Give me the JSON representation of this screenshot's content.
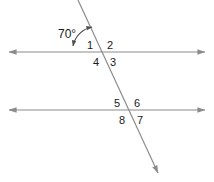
{
  "figure": {
    "background_color": "#ffffff",
    "line_color": "#8c8c8c",
    "text_color": "#1a1a1a",
    "arc_color": "#4d4d4d"
  },
  "angle_measure": {
    "value": "70°",
    "numeric": 70,
    "unit": "degrees"
  },
  "lines": [
    {
      "name": "upper-parallel-line",
      "type": "horizontal",
      "x1": 8,
      "y1": 52,
      "x2": 206,
      "y2": 52,
      "arrows": "both"
    },
    {
      "name": "lower-parallel-line",
      "type": "horizontal",
      "x1": 8,
      "y1": 110,
      "x2": 206,
      "y2": 110,
      "arrows": "both"
    },
    {
      "name": "transversal-line",
      "type": "oblique",
      "x1": 78,
      "y1": 0,
      "x2": 160,
      "y2": 178,
      "arrows": "end"
    }
  ],
  "intersections": [
    {
      "name": "upper-intersection",
      "x": 101,
      "y": 52
    },
    {
      "name": "lower-intersection",
      "x": 128,
      "y": 110
    }
  ],
  "angle_labels": [
    {
      "id": "1",
      "text": "1",
      "x": 90,
      "y": 48,
      "position": "upper-left-of-upper-intersection"
    },
    {
      "id": "2",
      "text": "2",
      "x": 110,
      "y": 48,
      "position": "upper-right-of-upper-intersection"
    },
    {
      "id": "3",
      "text": "3",
      "x": 113,
      "y": 64,
      "position": "lower-right-of-upper-intersection"
    },
    {
      "id": "4",
      "text": "4",
      "x": 96,
      "y": 64,
      "position": "lower-left-of-upper-intersection"
    },
    {
      "id": "5",
      "text": "5",
      "x": 117,
      "y": 106,
      "position": "upper-left-of-lower-intersection"
    },
    {
      "id": "6",
      "text": "6",
      "x": 137,
      "y": 106,
      "position": "upper-right-of-lower-intersection"
    },
    {
      "id": "7",
      "text": "7",
      "x": 140,
      "y": 122,
      "position": "lower-right-of-lower-intersection"
    },
    {
      "id": "8",
      "text": "8",
      "x": 122,
      "y": 122,
      "position": "lower-left-of-lower-intersection"
    }
  ],
  "angle_arc": {
    "name": "seventy-degree-arc",
    "label_x": 60,
    "label_y": 36,
    "path": "M 72 47 A 22 22 0 0 1 91 27",
    "arrows": "both"
  }
}
